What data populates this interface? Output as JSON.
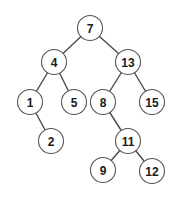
{
  "diagram": {
    "type": "binary-search-tree",
    "node_radius": 12.5,
    "colors": {
      "edge": "#4a4a4a",
      "node_stroke": "#555555",
      "node_fill": "#ffffff",
      "label": "#1a1a1a"
    },
    "nodes": [
      {
        "id": "n7",
        "label": "7",
        "x": 90,
        "y": 28
      },
      {
        "id": "n4",
        "label": "4",
        "x": 54,
        "y": 62
      },
      {
        "id": "n13",
        "label": "13",
        "x": 128,
        "y": 62
      },
      {
        "id": "n1",
        "label": "1",
        "x": 30,
        "y": 102
      },
      {
        "id": "n5",
        "label": "5",
        "x": 74,
        "y": 102
      },
      {
        "id": "n8",
        "label": "8",
        "x": 103,
        "y": 102
      },
      {
        "id": "n15",
        "label": "15",
        "x": 152,
        "y": 102
      },
      {
        "id": "n2",
        "label": "2",
        "x": 51,
        "y": 141
      },
      {
        "id": "n11",
        "label": "11",
        "x": 128,
        "y": 141
      },
      {
        "id": "n9",
        "label": "9",
        "x": 103,
        "y": 170
      },
      {
        "id": "n12",
        "label": "12",
        "x": 152,
        "y": 171
      }
    ],
    "edges": [
      {
        "from": "n7",
        "to": "n4"
      },
      {
        "from": "n7",
        "to": "n13"
      },
      {
        "from": "n4",
        "to": "n1"
      },
      {
        "from": "n4",
        "to": "n5"
      },
      {
        "from": "n13",
        "to": "n8"
      },
      {
        "from": "n13",
        "to": "n15"
      },
      {
        "from": "n1",
        "to": "n2"
      },
      {
        "from": "n8",
        "to": "n11"
      },
      {
        "from": "n11",
        "to": "n9"
      },
      {
        "from": "n11",
        "to": "n12"
      }
    ]
  }
}
